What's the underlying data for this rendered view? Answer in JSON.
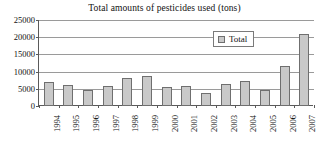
{
  "chart_data": {
    "type": "bar",
    "title": "Total amounts of pesticides used (tons)",
    "xlabel": "",
    "ylabel": "",
    "categories": [
      "1994",
      "1995",
      "1996",
      "1997",
      "1998",
      "1999",
      "2000",
      "2001",
      "2002",
      "2003",
      "2004",
      "2005",
      "2006",
      "2007"
    ],
    "series": [
      {
        "name": "Total",
        "values": [
          7000,
          6000,
          4800,
          5700,
          8000,
          8700,
          5500,
          5800,
          3800,
          6400,
          7400,
          4700,
          11500,
          21000
        ]
      }
    ],
    "ylim": [
      0,
      25000
    ],
    "yticks": [
      0,
      5000,
      10000,
      15000,
      20000,
      25000
    ],
    "ytick_labels": [
      "0",
      "5000",
      "10000",
      "15000",
      "20000",
      "25000"
    ],
    "grid": true,
    "legend_position": "upper right",
    "bar_fill_color": "#c9c9c9",
    "bar_edge_color": "#6f6f6f",
    "gridline_color": "#9a9a9a",
    "axis_color": "#5a5a5a"
  },
  "legend": {
    "entries": [
      {
        "label": "Total"
      }
    ]
  }
}
